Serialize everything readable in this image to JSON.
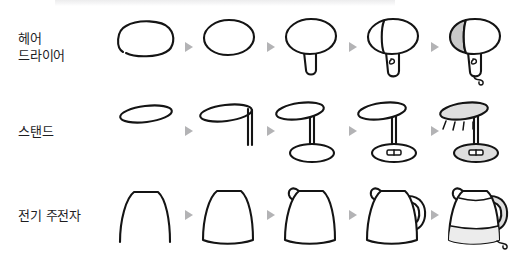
{
  "page": {
    "background_color": "#ffffff",
    "arrow_color": "#b3b3b5",
    "ink_color": "#141414",
    "shade_color": "#c9c9c9"
  },
  "rows": [
    {
      "label": "헤어\n드라이어",
      "subject": "hair-dryer",
      "step_count": 5,
      "steps": [
        {
          "index": 1,
          "name": "open-oval-outline",
          "description": "열린 타원 윤곽"
        },
        {
          "index": 2,
          "name": "closed-oval-body",
          "description": "닫힌 타원 본체"
        },
        {
          "index": 3,
          "name": "body-with-handle",
          "description": "손잡이 추가"
        },
        {
          "index": 4,
          "name": "nozzle-and-switch",
          "description": "노즐 선과 스위치"
        },
        {
          "index": 5,
          "name": "shaded-with-cord",
          "description": "음영과 전선"
        }
      ]
    },
    {
      "label": "스탠드",
      "subject": "desk-lamp-stand",
      "step_count": 5,
      "steps": [
        {
          "index": 1,
          "name": "flat-ellipse-shade",
          "description": "납작한 타원 갓"
        },
        {
          "index": 2,
          "name": "shade-with-stem",
          "description": "기둥 추가"
        },
        {
          "index": 3,
          "name": "stem-with-base",
          "description": "받침 추가"
        },
        {
          "index": 4,
          "name": "base-switch",
          "description": "받침 스위치"
        },
        {
          "index": 5,
          "name": "shaded-with-light",
          "description": "음영과 빛"
        }
      ]
    },
    {
      "label": "전기 주전자",
      "subject": "electric-kettle",
      "step_count": 5,
      "steps": [
        {
          "index": 1,
          "name": "open-arch-outline",
          "description": "열린 아치 윤곽"
        },
        {
          "index": 2,
          "name": "closed-trapezoid-body",
          "description": "닫힌 사다리꼴 본체"
        },
        {
          "index": 3,
          "name": "body-with-spout",
          "description": "주둥이 추가"
        },
        {
          "index": 4,
          "name": "body-with-handle",
          "description": "손잡이 추가"
        },
        {
          "index": 5,
          "name": "lid-water-and-cord",
          "description": "뚜껑·물·전선"
        }
      ]
    }
  ]
}
